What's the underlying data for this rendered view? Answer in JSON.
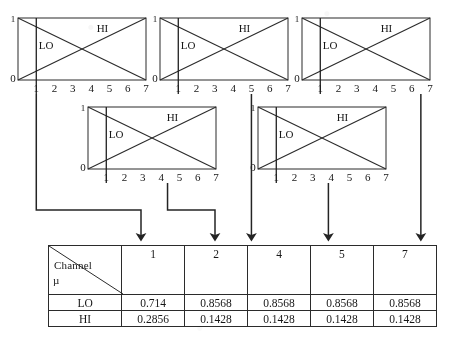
{
  "figure": {
    "kind": "fuzzy-membership-diagram",
    "stroke_color": "#2b2b2b",
    "background": "#ffffff"
  },
  "charts": [
    {
      "id": "chart-1",
      "x": 18,
      "y": 18,
      "w": 128,
      "h": 62,
      "y_top_label": "1",
      "y_zero_label": "0",
      "x_ticks": [
        "1",
        "2",
        "3",
        "4",
        "5",
        "6",
        "7"
      ],
      "series_labels": {
        "lo": "LO",
        "hi": "HI"
      },
      "lo_label_pos": {
        "x": 0.22,
        "y": 0.5
      },
      "hi_label_pos": {
        "x": 0.66,
        "y": 0.22
      },
      "marker_x": 1,
      "drop_x": 1,
      "drop_to_y": 210,
      "elbow_to_x": 141,
      "arrow_x": 141
    },
    {
      "id": "chart-2",
      "x": 160,
      "y": 18,
      "w": 128,
      "h": 62,
      "y_top_label": "1",
      "y_zero_label": "0",
      "x_ticks": [
        "1",
        "2",
        "3",
        "4",
        "5",
        "6",
        "7"
      ],
      "series_labels": {
        "lo": "LO",
        "hi": "HI"
      },
      "lo_label_pos": {
        "x": 0.22,
        "y": 0.5
      },
      "hi_label_pos": {
        "x": 0.66,
        "y": 0.22
      },
      "marker_x": 1,
      "drop_x": 5,
      "drop_to_y": 245,
      "arrow_x": 245
    },
    {
      "id": "chart-3",
      "x": 302,
      "y": 18,
      "w": 128,
      "h": 62,
      "y_top_label": "1",
      "y_zero_label": "0",
      "x_ticks": [
        "1",
        "2",
        "3",
        "4",
        "5",
        "6",
        "7"
      ],
      "series_labels": {
        "lo": "LO",
        "hi": "HI"
      },
      "lo_label_pos": {
        "x": 0.22,
        "y": 0.5
      },
      "hi_label_pos": {
        "x": 0.66,
        "y": 0.22
      },
      "marker_x": 1,
      "drop_x": 6.5,
      "drop_to_y": 245,
      "arrow_x": 410
    },
    {
      "id": "chart-4",
      "x": 88,
      "y": 107,
      "w": 128,
      "h": 62,
      "y_top_label": "1",
      "y_zero_label": "0",
      "x_ticks": [
        "1",
        "2",
        "3",
        "4",
        "5",
        "6",
        "7"
      ],
      "series_labels": {
        "lo": "LO",
        "hi": "HI"
      },
      "lo_label_pos": {
        "x": 0.22,
        "y": 0.5
      },
      "hi_label_pos": {
        "x": 0.66,
        "y": 0.22
      },
      "marker_x": 1,
      "drop_x": 4.35,
      "drop_to_y": 210,
      "elbow_to_x": 215,
      "arrow_x": 215
    },
    {
      "id": "chart-5",
      "x": 258,
      "y": 107,
      "w": 128,
      "h": 62,
      "y_top_label": "1",
      "y_zero_label": "0",
      "x_ticks": [
        "1",
        "2",
        "3",
        "4",
        "5",
        "6",
        "7"
      ],
      "series_labels": {
        "lo": "LO",
        "hi": "HI"
      },
      "lo_label_pos": {
        "x": 0.22,
        "y": 0.5
      },
      "hi_label_pos": {
        "x": 0.66,
        "y": 0.22
      },
      "marker_x": 1,
      "drop_x": 3.85,
      "drop_to_y": 245,
      "arrow_x": 327
    }
  ],
  "chart_data": {
    "type": "line",
    "title": "",
    "xlabel": "",
    "ylabel": "",
    "xlim": [
      0,
      7
    ],
    "ylim": [
      0,
      1
    ],
    "grid": false,
    "legend": [
      "LO",
      "HI"
    ],
    "series": [
      {
        "name": "LO",
        "x": [
          0,
          7
        ],
        "values": [
          1,
          0
        ]
      },
      {
        "name": "HI",
        "x": [
          0,
          7
        ],
        "values": [
          0,
          1
        ]
      }
    ],
    "markers": [
      1,
      1,
      1,
      1,
      1
    ],
    "drop_points": [
      1,
      5,
      6.5,
      4.35,
      3.85
    ]
  },
  "table": {
    "x": 48,
    "y": 245,
    "w": 389,
    "corner": {
      "col_label": "Channel",
      "row_label": "µ"
    },
    "columns": [
      "1",
      "2",
      "4",
      "5",
      "7"
    ],
    "rows": [
      {
        "label": "LO",
        "values": [
          "0.714",
          "0.8568",
          "0.8568",
          "0.8568",
          "0.8568"
        ]
      },
      {
        "label": "HI",
        "values": [
          "0.2856",
          "0.1428",
          "0.1428",
          "0.1428",
          "0.1428"
        ]
      }
    ]
  },
  "arrows": {
    "count": 5,
    "x_positions": [
      141,
      215,
      245,
      327,
      410
    ],
    "tip_y": 243
  }
}
